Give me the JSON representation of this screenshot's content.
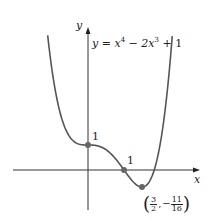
{
  "chart_data": {
    "type": "line",
    "title": "",
    "equation": "y = x^4 - 2x^3 + 1",
    "xlabel": "x",
    "ylabel": "y",
    "series": [
      {
        "name": "y = x^4 - 2x^3 + 1",
        "function": "x^4 - 2x^3 + 1",
        "domain": [
          -1.2,
          2.4
        ]
      }
    ],
    "points": [
      {
        "x": 0,
        "y": 1,
        "label": "1"
      },
      {
        "x": 1,
        "y": 0,
        "label": "1"
      },
      {
        "x": 1.5,
        "y": -0.6875,
        "label": "(3/2, -11/16)"
      }
    ],
    "grid": false
  },
  "labels": {
    "y_axis": "y",
    "x_axis": "x",
    "equation_lhs": "y = x",
    "equation_exp1": "4",
    "equation_mid": " − 2x",
    "equation_exp2": "3",
    "equation_rhs": " + 1",
    "point_0_1": "1",
    "point_1_0": "1",
    "min_x_num": "3",
    "min_x_den": "2",
    "min_y_num": "11",
    "min_y_den": "16"
  }
}
